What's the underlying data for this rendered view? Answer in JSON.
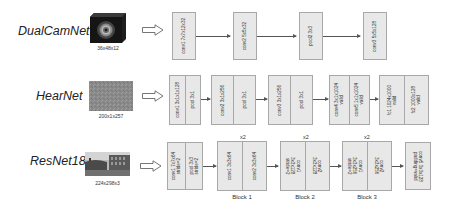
{
  "networks": [
    {
      "name": "DualCamNet",
      "input_dim": "36x48x12",
      "layers": [
        {
          "cells": [
            "conv1 7x7x12x32"
          ]
        },
        {
          "cells": [
            "conv2 5x5x32"
          ]
        },
        {
          "cells": [
            "pool2 3x3"
          ]
        },
        {
          "cells": [
            "conv3 5x5x128"
          ]
        }
      ]
    },
    {
      "name": "HearNet",
      "input_dim": "200x1x257",
      "layers": [
        {
          "cells": [
            "conv1 3x1x1x128",
            "pool 3x1"
          ]
        },
        {
          "cells": [
            "conv2 3x1x256",
            "pool 3x1"
          ]
        },
        {
          "cells": [
            "conv3 3x1x256",
            "pool 3x1"
          ]
        },
        {
          "cells": [
            "conv4 3x1x1024\nvalid",
            "conv5 1x1x1024\nvalid"
          ]
        },
        {
          "cells": [
            "fc1 1024x1000\nvalid",
            "fc2 1000x128\nvalid"
          ]
        }
      ]
    },
    {
      "name": "ResNet18",
      "input_dim": "224x298x3",
      "layers": [
        {
          "cells": [
            "conv1 7x7x64\nstride=2",
            "pool 3x3\nstride=2"
          ]
        },
        {
          "cells": [
            "conv1 3x3x64",
            "conv2 3x3x64"
          ],
          "repeat": "x2",
          "block": "Block 1"
        },
        {
          "cells": [
            "conv1\n3x3x128\nstride=2",
            "conv2\n3x3x128"
          ],
          "repeat": "x2",
          "block": "Block 2"
        },
        {
          "cells": [
            "conv1\n3x3x256\nstride=2",
            "conv2\n3x3x256"
          ],
          "repeat": "x2",
          "block": "Block 3"
        },
        {
          "cells": [
            "conv5 3x3x128\npadding=valid"
          ]
        }
      ]
    }
  ],
  "colors": {
    "box_fill": "#e8e8e8",
    "box_border": "#a8a8a8",
    "connector": "#555555"
  }
}
